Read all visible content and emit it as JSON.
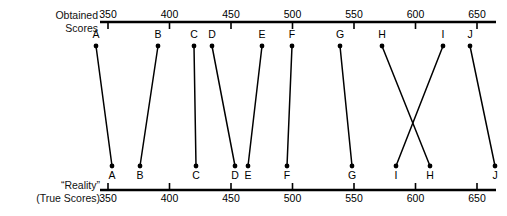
{
  "figure": {
    "type": "slope-chart",
    "top_axis": {
      "caption_line1": "Obtained",
      "caption_line2": "Scores",
      "ticks": [
        350,
        400,
        450,
        500,
        550,
        600,
        650
      ],
      "tick_labels": [
        "350",
        "400",
        "450",
        "500",
        "550",
        "600",
        "650"
      ],
      "labels_position": "above-axis",
      "ticks_position": "below-axis"
    },
    "bottom_axis": {
      "caption_line1": "“Reality”",
      "caption_line2": "(True Scores)",
      "ticks": [
        350,
        400,
        450,
        500,
        550,
        600,
        650
      ],
      "tick_labels": [
        "350",
        "400",
        "450",
        "500",
        "550",
        "600",
        "650"
      ],
      "labels_position": "below-axis",
      "ticks_position": "above-axis"
    },
    "line_color": "#000000",
    "axis_color": "#000000"
  },
  "chart_data": {
    "type": "line",
    "title": "",
    "subtitle": "",
    "xlabel": "",
    "ylabel": "",
    "xlim": [
      350,
      650
    ],
    "grid": false,
    "legend": "none",
    "top_axis_label": "Obtained Scores",
    "bottom_axis_label": "“Reality” (True Scores)",
    "axis_ticks": [
      350,
      400,
      450,
      500,
      550,
      600,
      650
    ],
    "series": [
      {
        "name": "Obtained Scores",
        "values": [
          344,
          428,
          455,
          467,
          498,
          516,
          545,
          571,
          604,
          619
        ]
      },
      {
        "name": "True Scores",
        "values": [
          353,
          370,
          456,
          478,
          485,
          506,
          557,
          581,
          599,
          657
        ]
      }
    ],
    "categories": [
      "A",
      "B",
      "C",
      "D",
      "E",
      "F",
      "G",
      "H",
      "I",
      "J"
    ],
    "points": [
      {
        "id": "A",
        "obtained": 344,
        "true": 353,
        "top_x": 96,
        "bottom_x": 112,
        "bottom_order": 1,
        "crosses": false
      },
      {
        "id": "B",
        "obtained": 428,
        "true": 370,
        "top_x": 158,
        "bottom_x": 140,
        "bottom_order": 2,
        "crosses": false
      },
      {
        "id": "C",
        "obtained": 455,
        "true": 456,
        "top_x": 194,
        "bottom_x": 196,
        "bottom_order": 3,
        "crosses": false
      },
      {
        "id": "D",
        "obtained": 467,
        "true": 478,
        "top_x": 212,
        "bottom_x": 235,
        "bottom_order": 4,
        "crosses": false
      },
      {
        "id": "E",
        "obtained": 498,
        "true": 485,
        "top_x": 262,
        "bottom_x": 248,
        "bottom_order": 5,
        "crosses": false
      },
      {
        "id": "F",
        "obtained": 516,
        "true": 506,
        "top_x": 292,
        "bottom_x": 287,
        "bottom_order": 6,
        "crosses": false
      },
      {
        "id": "G",
        "obtained": 545,
        "true": 557,
        "top_x": 340,
        "bottom_x": 352,
        "bottom_order": 7,
        "crosses": false
      },
      {
        "id": "H",
        "obtained": 571,
        "true": 599,
        "top_x": 382,
        "bottom_x": 430,
        "bottom_order": 9,
        "crosses": true
      },
      {
        "id": "I",
        "obtained": 604,
        "true": 581,
        "top_x": 443,
        "bottom_x": 396,
        "bottom_order": 8,
        "crosses": true
      },
      {
        "id": "J",
        "obtained": 619,
        "true": 657,
        "top_x": 470,
        "bottom_x": 495,
        "bottom_order": 10,
        "crosses": false
      }
    ]
  }
}
